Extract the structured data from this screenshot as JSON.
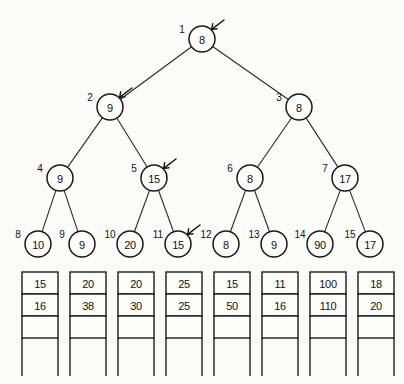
{
  "figure": {
    "background_color": "#fbfbf9",
    "ink_color": "#111111"
  },
  "tree": {
    "levels": [
      {
        "level": 1,
        "y": 39,
        "radius": 13,
        "nodes": [
          {
            "index": "1",
            "value": "8",
            "x": 202,
            "marker": true
          }
        ]
      },
      {
        "level": 2,
        "y": 107,
        "radius": 13,
        "nodes": [
          {
            "index": "2",
            "value": "9",
            "x": 110,
            "marker": true
          },
          {
            "index": "3",
            "value": "8",
            "x": 299,
            "marker": false
          }
        ]
      },
      {
        "level": 3,
        "y": 178,
        "radius": 13,
        "nodes": [
          {
            "index": "4",
            "value": "9",
            "x": 60,
            "marker": false
          },
          {
            "index": "5",
            "value": "15",
            "x": 154,
            "marker": true
          },
          {
            "index": "6",
            "value": "8",
            "x": 250,
            "marker": false
          },
          {
            "index": "7",
            "value": "17",
            "x": 345,
            "marker": false
          }
        ]
      },
      {
        "level": 4,
        "y": 244,
        "radius": 13,
        "nodes": [
          {
            "index": "8",
            "value": "10",
            "x": 38,
            "marker": false
          },
          {
            "index": "9",
            "value": "9",
            "x": 82,
            "marker": false
          },
          {
            "index": "10",
            "value": "20",
            "x": 130,
            "marker": false
          },
          {
            "index": "11",
            "value": "15",
            "x": 178,
            "marker": true
          },
          {
            "index": "12",
            "value": "8",
            "x": 226,
            "marker": false
          },
          {
            "index": "13",
            "value": "9",
            "x": 274,
            "marker": false
          },
          {
            "index": "14",
            "value": "90",
            "x": 320,
            "marker": false
          },
          {
            "index": "15",
            "value": "17",
            "x": 370,
            "marker": false
          }
        ]
      }
    ],
    "edges": [
      {
        "from": "1",
        "to": "2"
      },
      {
        "from": "1",
        "to": "3"
      },
      {
        "from": "2",
        "to": "4"
      },
      {
        "from": "2",
        "to": "5"
      },
      {
        "from": "3",
        "to": "6"
      },
      {
        "from": "3",
        "to": "7"
      },
      {
        "from": "4",
        "to": "8"
      },
      {
        "from": "4",
        "to": "9"
      },
      {
        "from": "5",
        "to": "10"
      },
      {
        "from": "5",
        "to": "11"
      },
      {
        "from": "6",
        "to": "12"
      },
      {
        "from": "6",
        "to": "13"
      },
      {
        "from": "7",
        "to": "14"
      },
      {
        "from": "7",
        "to": "15"
      }
    ]
  },
  "arrays": {
    "top": 272,
    "cell_width": 36,
    "cell_height": 22,
    "spacing": 48,
    "first_x": 22,
    "filled_rows": 2,
    "border_rows": 3,
    "stem_depth": 38,
    "columns": [
      {
        "column": 1,
        "values": [
          "15",
          "16"
        ]
      },
      {
        "column": 2,
        "values": [
          "20",
          "38"
        ]
      },
      {
        "column": 3,
        "values": [
          "20",
          "30"
        ]
      },
      {
        "column": 4,
        "values": [
          "25",
          "25"
        ]
      },
      {
        "column": 5,
        "values": [
          "15",
          "50"
        ]
      },
      {
        "column": 6,
        "values": [
          "11",
          "16"
        ]
      },
      {
        "column": 7,
        "values": [
          "100",
          "110"
        ]
      },
      {
        "column": 8,
        "values": [
          "18",
          "20"
        ]
      }
    ]
  }
}
